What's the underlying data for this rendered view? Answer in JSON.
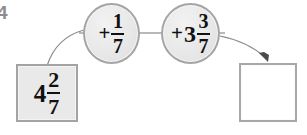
{
  "page": {
    "corner_mark": "4",
    "background_color": "#ffffff"
  },
  "diagram": {
    "type": "function-machine",
    "title": "",
    "input": {
      "label": "4 2/7",
      "whole": "4",
      "numerator": "2",
      "denominator": "7",
      "filled": true
    },
    "operations": [
      {
        "label": "+1/7",
        "sign": "+",
        "whole": "",
        "numerator": "1",
        "denominator": "7"
      },
      {
        "label": "+3 3/7",
        "sign": "+",
        "whole": "3",
        "numerator": "3",
        "denominator": "7"
      }
    ],
    "output": {
      "label": "",
      "filled": false
    },
    "connectors": [
      {
        "from": "input-box",
        "to": "operation-1",
        "style": "curve"
      },
      {
        "from": "operation-1",
        "to": "operation-2",
        "style": "straight"
      },
      {
        "from": "operation-2",
        "to": "output-box",
        "style": "curve-arrow"
      }
    ],
    "colors": {
      "box_border": "#9a9a9a",
      "box_fill": "#e9e9e9",
      "circle_border": "#a5a5a5",
      "circle_fill": "#e8e8e8",
      "line": "#8a8a8a",
      "text": "#111111",
      "corner_mark": "#8d8d8d"
    }
  }
}
